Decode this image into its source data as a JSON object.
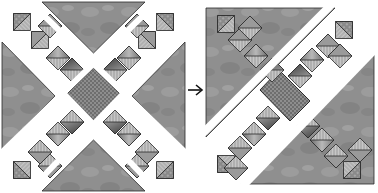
{
  "diagram": {
    "arrow_label": "→",
    "colors": {
      "background": "#ffffff",
      "setting_triangle": "#8e8e8e",
      "setting_triangle_light": "#a6a6a6",
      "hst_light": "#c8c8c8",
      "hst_mid": "#9a9a9a",
      "hst_dark": "#5a5a5a",
      "center_square": "#7a7a7a",
      "outline": "#2a2a2a",
      "sashing": "#ffffff"
    },
    "panels": [
      {
        "name": "before",
        "layout": "x-shaped with center square"
      },
      {
        "name": "after",
        "layout": "diagonal rows joined"
      }
    ]
  }
}
